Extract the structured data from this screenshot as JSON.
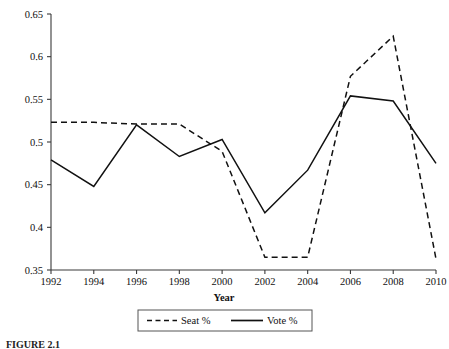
{
  "figure": {
    "caption_partial": "FIGURE 2.1",
    "background_color": "#ffffff",
    "ink_color": "#111111"
  },
  "axis": {
    "x_title": "Year",
    "y_title": "",
    "y_ticks": [
      "0.65",
      "0.6",
      "0.55",
      "0.5",
      "0.45",
      "0.4",
      "0.35"
    ],
    "x_ticks": [
      "1992",
      "1994",
      "1996",
      "1998",
      "2000",
      "2002",
      "2004",
      "2006",
      "2008",
      "2010"
    ]
  },
  "legend": {
    "position": "bottom-center",
    "entries": [
      {
        "label": "Seat %",
        "style": "dashed"
      },
      {
        "label": "Vote %",
        "style": "solid"
      }
    ]
  },
  "chart_data": {
    "type": "line",
    "title": "",
    "subtitle": "",
    "xlabel": "Year",
    "ylabel": "",
    "xlim": [
      1992,
      2010
    ],
    "ylim": [
      0.35,
      0.65
    ],
    "ytick_values": [
      0.65,
      0.6,
      0.55,
      0.5,
      0.45,
      0.4,
      0.35
    ],
    "grid": false,
    "legend_position": "bottom-center",
    "x": [
      1992,
      1994,
      1996,
      1998,
      2000,
      2002,
      2004,
      2006,
      2008,
      2010
    ],
    "categories": [
      "1992",
      "1994",
      "1996",
      "1998",
      "2000",
      "2002",
      "2004",
      "2006",
      "2008",
      "2010"
    ],
    "series": [
      {
        "name": "Seat %",
        "style": "dashed",
        "color": "#111111",
        "values": [
          0.523,
          0.523,
          0.521,
          0.521,
          0.489,
          0.365,
          0.365,
          0.577,
          0.624,
          0.363
        ]
      },
      {
        "name": "Vote %",
        "style": "solid",
        "color": "#111111",
        "values": [
          0.479,
          0.448,
          0.52,
          0.483,
          0.503,
          0.417,
          0.467,
          0.554,
          0.548,
          0.475
        ]
      }
    ],
    "annotations": []
  }
}
